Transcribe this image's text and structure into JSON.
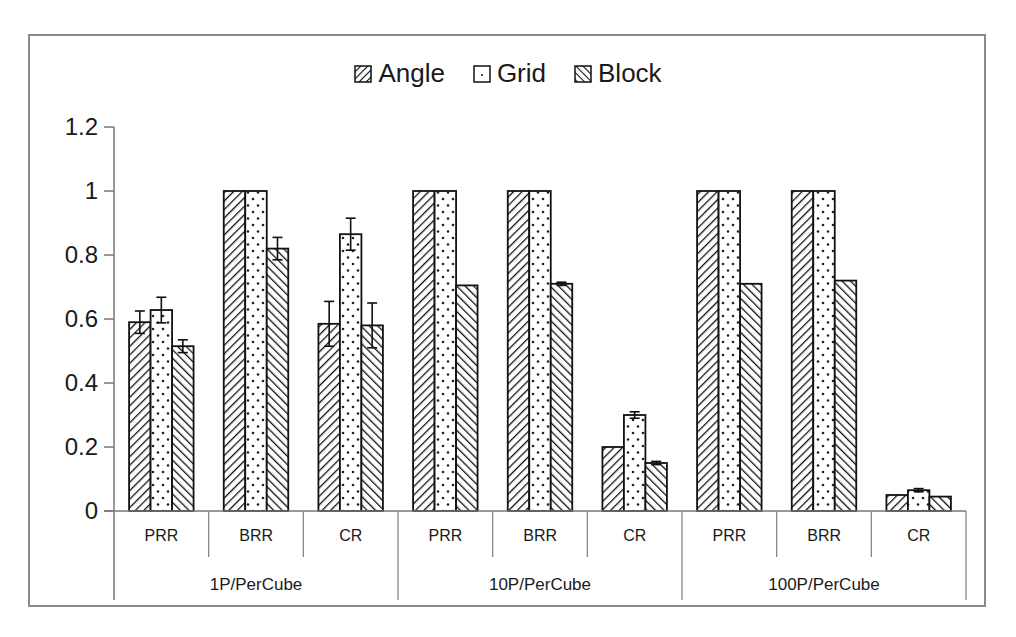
{
  "chart_data": {
    "type": "bar",
    "title": "",
    "xlabel": "",
    "ylabel": "",
    "ylim": [
      0,
      1.2
    ],
    "yticks": [
      "0",
      "0.2",
      "0.4",
      "0.6",
      "0.8",
      "1",
      "1.2"
    ],
    "grid": false,
    "legend_position": "top",
    "groups": [
      "1P/PerCube",
      "10P/PerCube",
      "100P/PerCube"
    ],
    "categories": [
      "PRR",
      "BRR",
      "CR",
      "PRR",
      "BRR",
      "CR",
      "PRR",
      "BRR",
      "CR"
    ],
    "series": [
      {
        "name": "Angle",
        "pattern": "diagonal-up",
        "values": [
          0.59,
          1.0,
          0.585,
          1.0,
          1.0,
          0.2,
          1.0,
          1.0,
          0.05
        ],
        "errors": [
          0.035,
          0.0,
          0.07,
          0.0,
          0.0,
          0.0,
          0.0,
          0.0,
          0.0
        ]
      },
      {
        "name": "Grid",
        "pattern": "dotted",
        "values": [
          0.628,
          1.0,
          0.865,
          1.0,
          1.0,
          0.3,
          1.0,
          1.0,
          0.065
        ],
        "errors": [
          0.04,
          0.0,
          0.05,
          0.0,
          0.0,
          0.01,
          0.0,
          0.0,
          0.005
        ]
      },
      {
        "name": "Block",
        "pattern": "diagonal-down",
        "values": [
          0.515,
          0.82,
          0.58,
          0.705,
          0.71,
          0.15,
          0.71,
          0.72,
          0.045
        ],
        "errors": [
          0.02,
          0.035,
          0.07,
          0.0,
          0.005,
          0.005,
          0.0,
          0.0,
          0.0
        ]
      }
    ]
  },
  "legend": {
    "items": [
      {
        "label": "Angle"
      },
      {
        "label": "Grid"
      },
      {
        "label": "Block"
      }
    ]
  }
}
